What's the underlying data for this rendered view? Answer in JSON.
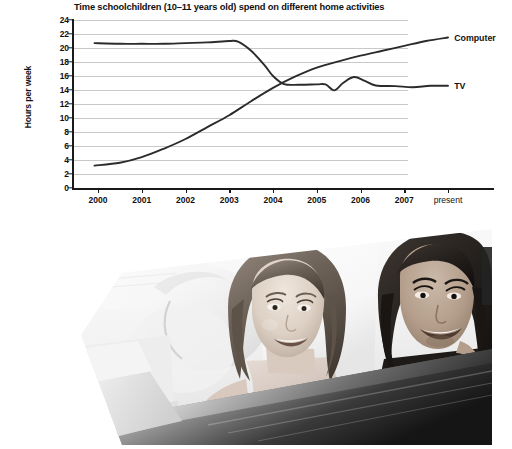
{
  "figure": {
    "photo": {
      "alt_name": "photo-two-girls-at-screen",
      "caption": ""
    }
  },
  "chart_data": {
    "type": "line",
    "title": "Time schoolchildren (10–11 years old) spend on different home activities",
    "xlabel": "",
    "ylabel": "Hours per week",
    "ylim": [
      0,
      24
    ],
    "ytick_step": 2,
    "yticks": [
      "24",
      "22",
      "20",
      "18",
      "16",
      "14",
      "12",
      "10",
      "8",
      "6",
      "4",
      "2",
      "0"
    ],
    "grid": true,
    "grid_color": "#c9c9c9",
    "axis_color": "#1a1a1a",
    "line_color": "#2b2b2b",
    "legend_position": "right-inline",
    "categories": [
      "2000",
      "2001",
      "2002",
      "2003",
      "2004",
      "2005",
      "2006",
      "2007",
      "present"
    ],
    "x": [
      2000,
      2001,
      2002,
      2003,
      2004,
      2005,
      2006,
      2007,
      2008
    ],
    "series": [
      {
        "name": "TV",
        "label": "TV",
        "values": [
          20.7,
          20.6,
          20.7,
          21.0,
          15.3,
          14.8,
          15.3,
          14.6,
          14.6
        ],
        "points": [
          [
            1999.92,
            20.7
          ],
          [
            2000.5,
            20.6
          ],
          [
            2001.0,
            20.6
          ],
          [
            2001.5,
            20.6
          ],
          [
            2002.0,
            20.7
          ],
          [
            2002.5,
            20.8
          ],
          [
            2003.0,
            21.0
          ],
          [
            2003.2,
            20.9
          ],
          [
            2003.5,
            19.6
          ],
          [
            2003.8,
            17.6
          ],
          [
            2004.0,
            16.0
          ],
          [
            2004.25,
            14.85
          ],
          [
            2004.6,
            14.75
          ],
          [
            2005.0,
            14.8
          ],
          [
            2005.2,
            14.8
          ],
          [
            2005.4,
            13.95
          ],
          [
            2005.6,
            15.0
          ],
          [
            2005.85,
            15.85
          ],
          [
            2006.1,
            15.3
          ],
          [
            2006.35,
            14.65
          ],
          [
            2006.8,
            14.55
          ],
          [
            2007.2,
            14.4
          ],
          [
            2007.6,
            14.6
          ],
          [
            2008.0,
            14.6
          ]
        ]
      },
      {
        "name": "Computer",
        "label": "Computer",
        "values": [
          3.2,
          4.4,
          7.0,
          10.4,
          14.3,
          17.2,
          18.9,
          20.3,
          21.5
        ],
        "points": [
          [
            1999.92,
            3.2
          ],
          [
            2000.5,
            3.6
          ],
          [
            2001.0,
            4.4
          ],
          [
            2001.5,
            5.6
          ],
          [
            2002.0,
            7.0
          ],
          [
            2002.5,
            8.7
          ],
          [
            2003.0,
            10.4
          ],
          [
            2003.5,
            12.4
          ],
          [
            2004.0,
            14.3
          ],
          [
            2004.5,
            15.9
          ],
          [
            2005.0,
            17.2
          ],
          [
            2005.5,
            18.1
          ],
          [
            2006.0,
            18.9
          ],
          [
            2006.5,
            19.6
          ],
          [
            2007.0,
            20.3
          ],
          [
            2007.5,
            21.0
          ],
          [
            2008.0,
            21.5
          ]
        ]
      }
    ],
    "annotations": [
      {
        "text": "Computer",
        "x": 2008.05,
        "y": 21.5
      },
      {
        "text": "TV",
        "x": 2008.05,
        "y": 14.6
      }
    ]
  }
}
